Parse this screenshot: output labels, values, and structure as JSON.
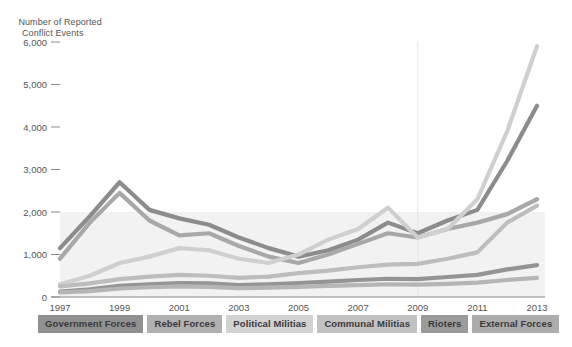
{
  "chart_data": {
    "type": "line",
    "title": "",
    "subtitle": "",
    "ylabel_line1": "Number of Reported",
    "ylabel_line2": "Conflict Events",
    "xlabel": "",
    "ylim": [
      0,
      6000
    ],
    "xlim": [
      1997,
      2013
    ],
    "grid": false,
    "legend_position": "bottom",
    "band": {
      "from": 0,
      "to": 2000,
      "color": "#f2f2f2"
    },
    "ytick_labels": [
      "6,000",
      "5,000",
      "4,000",
      "3,000",
      "2,000",
      "1,000",
      "0"
    ],
    "ytick_values": [
      6000,
      5000,
      4000,
      3000,
      2000,
      1000,
      0
    ],
    "xtick_labels": [
      "1997",
      "1999",
      "2001",
      "2003",
      "2005",
      "2007",
      "2009",
      "2011",
      "2013"
    ],
    "xtick_values": [
      1997,
      1999,
      2001,
      2003,
      2005,
      2007,
      2009,
      2011,
      2013
    ],
    "x": [
      1997,
      1998,
      1999,
      2000,
      2001,
      2002,
      2003,
      2004,
      2005,
      2006,
      2007,
      2008,
      2009,
      2010,
      2011,
      2012,
      2013
    ],
    "series": [
      {
        "name": "Government Forces",
        "color": "#8c8c8c",
        "values": [
          1150,
          1900,
          2700,
          2050,
          1850,
          1700,
          1400,
          1150,
          950,
          1100,
          1350,
          1750,
          1500,
          1800,
          2050,
          3200,
          4500
        ]
      },
      {
        "name": "Rebel Forces",
        "color": "#a8a8a8",
        "values": [
          900,
          1750,
          2450,
          1800,
          1450,
          1500,
          1200,
          950,
          800,
          1000,
          1250,
          1500,
          1400,
          1600,
          1750,
          1950,
          2300
        ]
      },
      {
        "name": "Political Militias",
        "color": "#cfcfcf",
        "values": [
          300,
          500,
          800,
          950,
          1150,
          1100,
          900,
          800,
          1000,
          1350,
          1600,
          2100,
          1400,
          1600,
          2300,
          3900,
          5900
        ]
      },
      {
        "name": "Communal Militias",
        "color": "#bdbdbd",
        "values": [
          250,
          320,
          420,
          480,
          520,
          500,
          450,
          480,
          560,
          620,
          700,
          760,
          780,
          900,
          1050,
          1750,
          2150
        ]
      },
      {
        "name": "Rioters",
        "color": "#949494",
        "values": [
          130,
          180,
          260,
          300,
          330,
          320,
          280,
          300,
          330,
          360,
          400,
          430,
          420,
          470,
          520,
          650,
          750
        ]
      },
      {
        "name": "External Forces",
        "color": "#b5b5b5",
        "values": [
          110,
          140,
          200,
          230,
          250,
          240,
          210,
          220,
          240,
          260,
          280,
          300,
          290,
          310,
          340,
          400,
          450
        ]
      }
    ],
    "annotations": []
  },
  "legend": {
    "items": [
      {
        "label": "Government Forces",
        "bg": "#909090"
      },
      {
        "label": "Rebel Forces",
        "bg": "#b0b0b0"
      },
      {
        "label": "Political Militias",
        "bg": "#d2d2d2"
      },
      {
        "label": "Communal Militias",
        "bg": "#c2c2c2"
      },
      {
        "label": "Rioters",
        "bg": "#9b9b9b"
      },
      {
        "label": "External Forces",
        "bg": "#adadad"
      }
    ]
  }
}
